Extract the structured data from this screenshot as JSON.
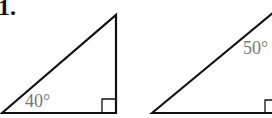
{
  "problem": {
    "number_label": "1."
  },
  "triangles": [
    {
      "id": "left",
      "angle_label": "40°",
      "angle_position": "bottom-left",
      "right_angle": "bottom-right"
    },
    {
      "id": "right",
      "angle_label": "50°",
      "angle_position": "top",
      "right_angle": "bottom-right"
    }
  ],
  "colors": {
    "stroke": "#111111",
    "angle_text": "#777777",
    "background": "#ffffff"
  }
}
